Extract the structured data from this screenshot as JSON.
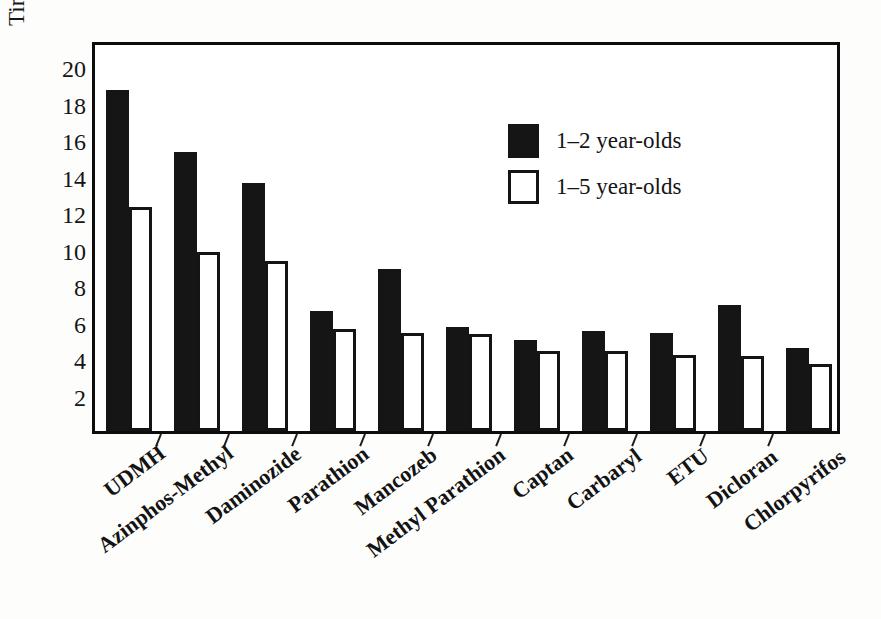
{
  "chart_data": {
    "type": "bar",
    "title": "",
    "subtitle": "",
    "xlabel": "",
    "ylabel": "Times greater than women's exposure",
    "categories": [
      "UDMH",
      "Azinphos-Methyl",
      "Daminozide",
      "Parathion",
      "Mancozeb",
      "Methyl Parathion",
      "Captan",
      "Carbaryl",
      "ETU",
      "Dicloran",
      "Chlorpyrifos"
    ],
    "series": [
      {
        "name": "1–2 year-olds",
        "color": "#151515",
        "style": "filled",
        "values": [
          18.7,
          15.3,
          13.6,
          6.6,
          8.9,
          5.7,
          5.0,
          5.5,
          5.4,
          6.9,
          4.55
        ]
      },
      {
        "name": "1–5 year-olds",
        "color": "#ffffff",
        "style": "outline",
        "values": [
          12.3,
          9.8,
          9.35,
          5.6,
          5.4,
          5.3,
          4.4,
          4.4,
          4.15,
          4.1,
          3.65
        ]
      }
    ],
    "ylim": [
      0,
      21.5
    ],
    "yticks": [
      2,
      4,
      6,
      8,
      10,
      12,
      14,
      16,
      18,
      20
    ],
    "ytick_labels": [
      "2",
      "4",
      "6",
      "8",
      "10",
      "12",
      "14",
      "16",
      "18",
      "20"
    ],
    "grid": false,
    "legend_position": "upper-right-inside",
    "frame": true
  },
  "legend": {
    "entries": [
      {
        "label": "1–2 year-olds",
        "swatch": "filled-black-square"
      },
      {
        "label": "1–5 year-olds",
        "swatch": "outlined-white-square"
      }
    ]
  },
  "axes": {
    "y_title": "Times greater than women's exposure"
  }
}
